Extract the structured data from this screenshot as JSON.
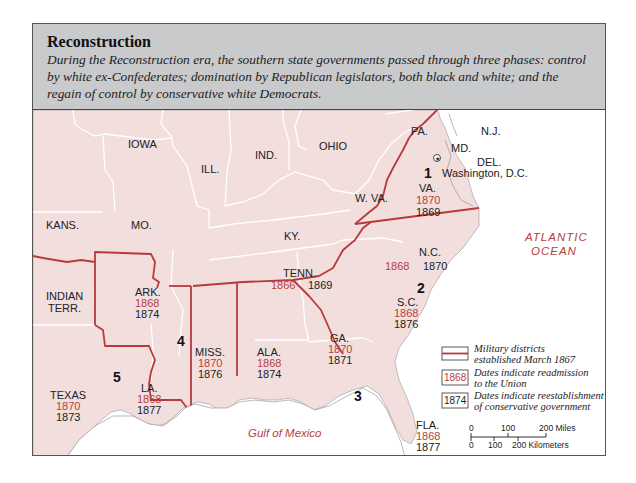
{
  "header": {
    "title": "Reconstruction",
    "caption": "During the Reconstruction era, the southern state governments passed through three phases: control by white ex-Confederates; domination by Republican legislators, both black and white; and the regain of control by conservative white Democrats."
  },
  "colors": {
    "land": "#f3dede",
    "header_bg": "#c9cacc",
    "district_line": "#b83a3a",
    "readmission_date": "#b5413d",
    "conservative_date": "#222222",
    "water": "#ffffff"
  },
  "states": {
    "iowa": {
      "label": "IOWA"
    },
    "ill": {
      "label": "ILL."
    },
    "ind": {
      "label": "IND."
    },
    "ohio": {
      "label": "OHIO"
    },
    "pa": {
      "label": "PA."
    },
    "nj": {
      "label": "N.J."
    },
    "md": {
      "label": "MD."
    },
    "del": {
      "label": "DEL."
    },
    "kans": {
      "label": "KANS."
    },
    "mo": {
      "label": "MO."
    },
    "ky": {
      "label": "KY."
    },
    "wva": {
      "label": "W. VA."
    },
    "indian_terr": {
      "label1": "INDIAN",
      "label2": "TERR."
    },
    "va": {
      "label": "VA.",
      "readmission": "1870",
      "conservative": "1869"
    },
    "nc": {
      "label": "N.C.",
      "readmission": "1868",
      "conservative": "1870"
    },
    "tenn": {
      "label": "TENN.",
      "readmission": "1866",
      "conservative": "1869"
    },
    "sc": {
      "label": "S.C.",
      "readmission": "1868",
      "conservative": "1876"
    },
    "ark": {
      "label": "ARK.",
      "readmission": "1868",
      "conservative": "1874"
    },
    "miss": {
      "label": "MISS.",
      "readmission": "1870",
      "conservative": "1876"
    },
    "ala": {
      "label": "ALA.",
      "readmission": "1868",
      "conservative": "1874"
    },
    "ga": {
      "label": "GA.",
      "readmission": "1870",
      "conservative": "1871"
    },
    "la": {
      "label": "LA.",
      "readmission": "1868",
      "conservative": "1877"
    },
    "texas": {
      "label": "TEXAS",
      "readmission": "1870",
      "conservative": "1873"
    },
    "fla": {
      "label": "FLA.",
      "readmission": "1868",
      "conservative": "1877"
    }
  },
  "cities": {
    "washington": {
      "label": "Washington, D.C.",
      "icon": "capital-star-icon"
    }
  },
  "districts": [
    "1",
    "2",
    "3",
    "4",
    "5"
  ],
  "water_labels": {
    "atlantic1": "ATLANTIC",
    "atlantic2": "OCEAN",
    "gulf": "Gulf of Mexico"
  },
  "legend": {
    "districts_line1": "Military districts",
    "districts_line2": "established March 1867",
    "readmission_sample": "1868",
    "readmission_line1": "Dates indicate readmission",
    "readmission_line2": "to the Union",
    "conservative_sample": "1874",
    "conservative_line1": "Dates indicate reestablishment",
    "conservative_line2": "of conservative government"
  },
  "scale": {
    "miles": [
      "0",
      "100",
      "200 Miles"
    ],
    "km": [
      "0",
      "100",
      "200 Kilometers"
    ]
  }
}
